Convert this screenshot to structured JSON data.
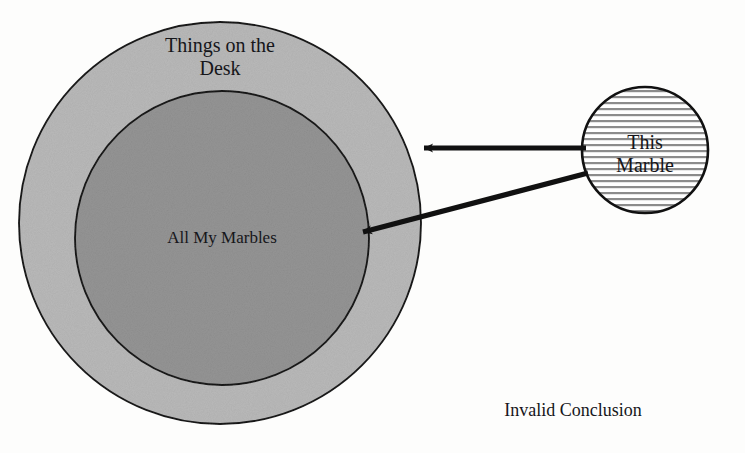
{
  "diagram": {
    "type": "euler-venn",
    "background_color": "#fdfdfc",
    "outline_color": "#1a1a1a",
    "outer_set": {
      "label": "Things on the\nDesk",
      "fill_color": "#b9b9b9",
      "cx": 220,
      "cy": 223,
      "r": 201
    },
    "inner_set": {
      "label": "All My Marbles",
      "fill_color": "#949494",
      "cx": 222,
      "cy": 238,
      "r": 147
    },
    "marble_set": {
      "label": "This\nMarble",
      "fill_pattern": "horizontal-lines",
      "fill_color": "#ffffff",
      "line_color": "#8c8c8c",
      "cx": 645,
      "cy": 150,
      "r": 63
    },
    "arrows": [
      {
        "name": "arrow-to-things-on-desk",
        "from_x": 586,
        "from_y": 148,
        "to_x": 420,
        "to_y": 148,
        "color": "#111111"
      },
      {
        "name": "arrow-to-all-my-marbles",
        "from_x": 586,
        "from_y": 173,
        "to_x": 358,
        "to_y": 233,
        "color": "#111111"
      }
    ],
    "caption": "Invalid Conclusion"
  }
}
